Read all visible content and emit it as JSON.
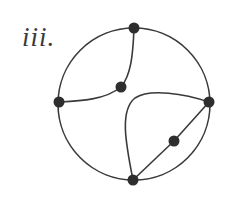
{
  "diagram": {
    "label": "iii.",
    "colors": {
      "stroke": "#3a3a3a",
      "node": "#2e2e2e",
      "background": "#ffffff"
    },
    "circle": {
      "cx": 134,
      "cy": 104,
      "r": 76
    },
    "nodes": [
      {
        "id": "top",
        "x": 134,
        "y": 28
      },
      {
        "id": "inner-upper",
        "x": 121,
        "y": 87
      },
      {
        "id": "left",
        "x": 59,
        "y": 102
      },
      {
        "id": "right",
        "x": 209,
        "y": 102
      },
      {
        "id": "inner-lower",
        "x": 174,
        "y": 141
      },
      {
        "id": "bottom",
        "x": 133,
        "y": 180
      }
    ],
    "edges": [
      {
        "from": "top",
        "to": "inner-upper",
        "shape": "curve"
      },
      {
        "from": "inner-upper",
        "to": "left",
        "shape": "curve"
      },
      {
        "from": "bottom",
        "to": "right",
        "shape": "curve"
      },
      {
        "from": "bottom",
        "to": "inner-lower",
        "shape": "line"
      },
      {
        "from": "inner-lower",
        "to": "right",
        "shape": "line"
      }
    ]
  }
}
